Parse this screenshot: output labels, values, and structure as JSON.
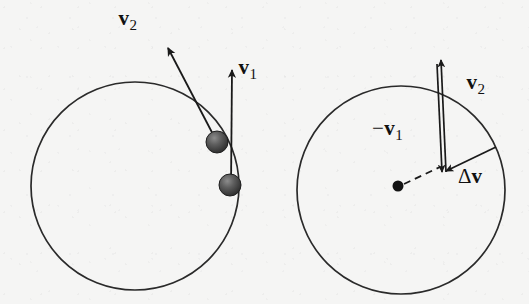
{
  "figure": {
    "background_color": "#f5f5f4",
    "ink_color": "#1a1a1a",
    "width": 529,
    "height": 304
  },
  "left_panel": {
    "name": "circular-path-with-velocity-vectors",
    "circle": {
      "cx": 135,
      "cy": 186,
      "r": 104
    },
    "particles": [
      {
        "id": "particle-upper",
        "cx": 217,
        "cy": 142,
        "r": 11
      },
      {
        "id": "particle-lower",
        "cx": 230,
        "cy": 185,
        "r": 11
      }
    ],
    "vectors": [
      {
        "id": "v2",
        "label": "v",
        "subscript": "2",
        "sign": "",
        "from": {
          "x": 217,
          "y": 142
        },
        "to": {
          "x": 168,
          "y": 48
        },
        "label_pos": {
          "x": 118,
          "y": 8
        }
      },
      {
        "id": "v1",
        "label": "v",
        "subscript": "1",
        "sign": "",
        "from": {
          "x": 231,
          "y": 187
        },
        "to": {
          "x": 232,
          "y": 70
        },
        "label_pos": {
          "x": 238,
          "y": 57
        }
      }
    ]
  },
  "right_panel": {
    "name": "vector-difference-construction",
    "circle": {
      "cx": 401,
      "cy": 190,
      "r": 104
    },
    "center_dot": {
      "cx": 398,
      "cy": 186,
      "r": 5.5
    },
    "dashed_radius": {
      "from": {
        "x": 404,
        "y": 184
      },
      "to": {
        "x": 440,
        "y": 167
      }
    },
    "vectors": [
      {
        "id": "minus-v1",
        "label": "v",
        "subscript": "1",
        "sign": "−",
        "from": {
          "x": 437,
          "y": 64
        },
        "to": {
          "x": 442,
          "y": 172
        },
        "label_pos": {
          "x": 372,
          "y": 118
        }
      },
      {
        "id": "v2",
        "label": "v",
        "subscript": "2",
        "sign": "",
        "from": {
          "x": 446,
          "y": 172
        },
        "to": {
          "x": 441,
          "y": 60
        },
        "label_pos": {
          "x": 466,
          "y": 72
        }
      },
      {
        "id": "delta-v",
        "label": "v",
        "subscript": "",
        "sign": "Δ",
        "from": {
          "x": 496,
          "y": 147
        },
        "to": {
          "x": 446,
          "y": 171
        },
        "label_pos": {
          "x": 458,
          "y": 166
        }
      }
    ]
  }
}
